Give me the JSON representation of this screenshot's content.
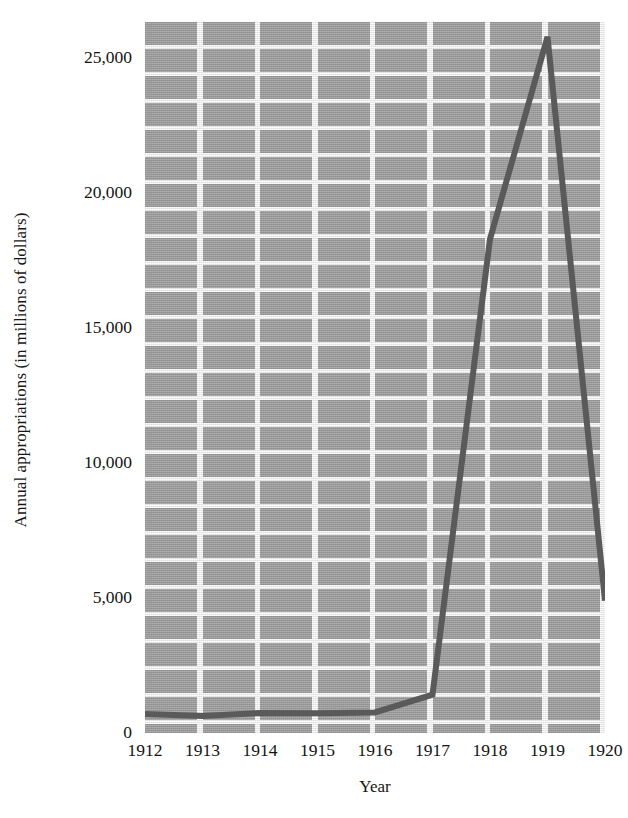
{
  "chart_data": {
    "type": "line",
    "title": "",
    "xlabel": "Year",
    "ylabel": "Annual appropriations (in millions of dollars)",
    "x": [
      1912,
      1913,
      1914,
      1915,
      1916,
      1917,
      1918,
      1919,
      1920
    ],
    "categories": [
      "1912",
      "1913",
      "1914",
      "1915",
      "1916",
      "1917",
      "1918",
      "1919",
      "1920"
    ],
    "values": [
      700,
      630,
      740,
      730,
      760,
      1420,
      18300,
      25800,
      4900
    ],
    "series": [
      {
        "name": "Annual appropriations",
        "values": [
          700,
          630,
          740,
          730,
          760,
          1420,
          18300,
          25800,
          4900
        ]
      }
    ],
    "xtick_labels": [
      "1912",
      "1913",
      "1914",
      "1915",
      "1916",
      "1917",
      "1918",
      "1919",
      "1920"
    ],
    "ytick_labels": [
      "0",
      "5,000",
      "10,000",
      "15,000",
      "20,000",
      "25,000"
    ],
    "ytick_values": [
      0,
      5000,
      10000,
      15000,
      20000,
      25000
    ],
    "ylim": [
      0,
      26350
    ],
    "xlim": [
      1912,
      1920
    ],
    "grid": true,
    "legend": "none",
    "line_color": "#5a5a5a",
    "plot_background_color": "#a3a3a3",
    "gridline_color": "#fdfdfd",
    "figure_background_color": "#ffffff"
  }
}
